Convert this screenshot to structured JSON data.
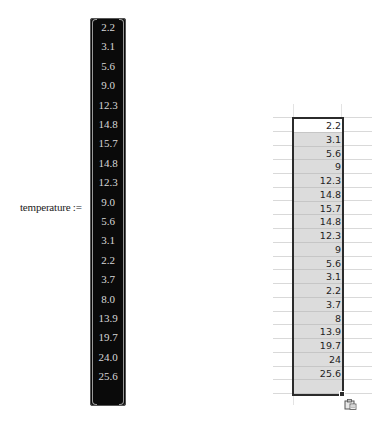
{
  "mathcad": {
    "variable_label": "temperature :=",
    "values": [
      "2.2",
      "3.1",
      "5.6",
      "9.0",
      "12.3",
      "14.8",
      "15.7",
      "14.8",
      "12.3",
      "9.0",
      "5.6",
      "3.1",
      "2.2",
      "3.7",
      "8.0",
      "13.9",
      "19.7",
      "24.0",
      "25.6"
    ]
  },
  "excel": {
    "values": [
      "2.2",
      "3.1",
      "5.6",
      "9",
      "12.3",
      "14.8",
      "15.7",
      "14.8",
      "12.3",
      "9",
      "5.6",
      "3.1",
      "2.2",
      "3.7",
      "8",
      "13.9",
      "19.7",
      "24",
      "25.6"
    ],
    "paste_options_icon": "clipboard-paste-icon"
  },
  "colors": {
    "matrix_bg": "#0a0a0a",
    "matrix_text": "#d8d8d8",
    "selection_fill": "#dcdcdc",
    "selection_border": "#2b2b2b",
    "gridline": "#d9d9d9"
  }
}
